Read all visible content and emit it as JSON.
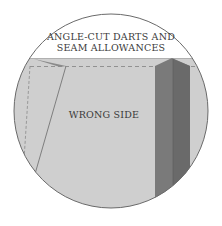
{
  "diagram": {
    "title_line1": "ANGLE-CUT DARTS AND",
    "title_line2": "SEAM ALLOWANCES",
    "fabric_label": "WRONG SIDE"
  },
  "colors": {
    "background": "#ffffff",
    "fabric": "#cfcfcf",
    "fabric_edge": "#b8b8b8",
    "dart": "#7a7a7a",
    "dart_dark": "#666666",
    "circle_border": "#6a6a6a",
    "dashed_line": "#8a8a8a",
    "text": "#3a3a3a"
  }
}
